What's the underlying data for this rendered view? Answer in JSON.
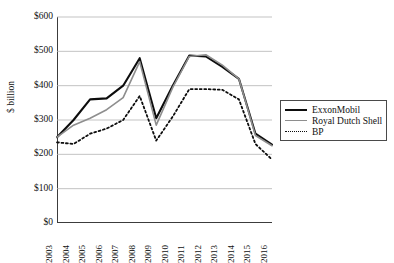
{
  "chart_data": {
    "type": "line",
    "title": "",
    "xlabel": "",
    "ylabel": "$ billion",
    "ylim": [
      0,
      600
    ],
    "yticks": [
      0,
      100,
      200,
      300,
      400,
      500,
      600
    ],
    "ytick_labels": [
      "$0",
      "$100",
      "$200",
      "$300",
      "$400",
      "$500",
      "$600"
    ],
    "grid": true,
    "grid_axis": "y",
    "legend_position": "right",
    "categories": [
      2003,
      2004,
      2005,
      2006,
      2007,
      2008,
      2009,
      2010,
      2011,
      2012,
      2013,
      2014,
      2015,
      2016
    ],
    "xtick_labels": [
      "2003",
      "2004",
      "2005",
      "2006",
      "2007",
      "2008",
      "2009",
      "2010",
      "2011",
      "2012",
      "2013",
      "2014",
      "2015",
      "2016"
    ],
    "series": [
      {
        "name": "ExxonMobil",
        "color": "#0d0d0d",
        "style": "solid",
        "width": 2.1,
        "values": [
          250,
          300,
          360,
          363,
          400,
          480,
          305,
          400,
          488,
          485,
          455,
          420,
          260,
          228
        ]
      },
      {
        "name": "Royal Dutch Shell",
        "color": "#8e8e8e",
        "style": "solid",
        "width": 1.6,
        "values": [
          250,
          285,
          305,
          330,
          365,
          470,
          285,
          395,
          485,
          490,
          460,
          420,
          255,
          225
        ]
      },
      {
        "name": "BP",
        "color": "#0d0d0d",
        "style": "dotted",
        "width": 1.8,
        "values": [
          235,
          230,
          260,
          275,
          300,
          370,
          240,
          310,
          390,
          390,
          388,
          360,
          230,
          185
        ]
      }
    ]
  },
  "legend": {
    "items": [
      {
        "label": "ExxonMobil"
      },
      {
        "label": "Royal Dutch Shell"
      },
      {
        "label": "BP"
      }
    ]
  },
  "axes": {
    "y_title": "$ billion"
  }
}
